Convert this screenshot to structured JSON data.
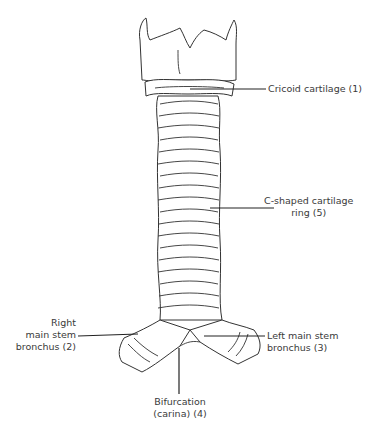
{
  "diagram": {
    "labels": [
      {
        "id": "cricoid",
        "text": "Cricoid cartilage (1)"
      },
      {
        "id": "c-ring-line1",
        "text": "C-shaped cartilage"
      },
      {
        "id": "c-ring-line2",
        "text": "ring (5)"
      },
      {
        "id": "right-line1",
        "text": "Right"
      },
      {
        "id": "right-line2",
        "text": "main stem"
      },
      {
        "id": "right-line3",
        "text": "bronchus (2)"
      },
      {
        "id": "left-line1",
        "text": "Left main stem"
      },
      {
        "id": "left-line2",
        "text": "bronchus (3)"
      },
      {
        "id": "bif-line1",
        "text": "Bifurcation"
      },
      {
        "id": "bif-line2",
        "text": "(carina) (4)"
      }
    ],
    "colors": {
      "line": "#333333",
      "text": "#3a3a3a",
      "background": "#ffffff"
    }
  }
}
